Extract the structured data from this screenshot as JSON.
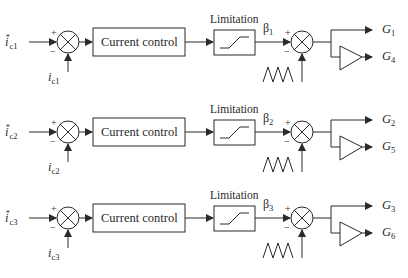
{
  "rows": [
    {
      "reference": {
        "symbol": "i",
        "super": "*",
        "sub": "c1"
      },
      "feedback": {
        "symbol": "i",
        "sub": "c1"
      },
      "controller_label": "Current control",
      "limiter_label": "Limitation",
      "beta": {
        "symbol": "β",
        "sub": "1"
      },
      "output_direct": {
        "symbol": "G",
        "sub": "1"
      },
      "output_inverted": {
        "symbol": "G",
        "sub": "4"
      }
    },
    {
      "reference": {
        "symbol": "i",
        "super": "*",
        "sub": "c2"
      },
      "feedback": {
        "symbol": "i",
        "sub": "c2"
      },
      "controller_label": "Current control",
      "limiter_label": "Limitation",
      "beta": {
        "symbol": "β",
        "sub": "2"
      },
      "output_direct": {
        "symbol": "G",
        "sub": "2"
      },
      "output_inverted": {
        "symbol": "G",
        "sub": "5"
      }
    },
    {
      "reference": {
        "symbol": "i",
        "super": "*",
        "sub": "c3"
      },
      "feedback": {
        "symbol": "i",
        "sub": "c3"
      },
      "controller_label": "Current control",
      "limiter_label": "Limitation",
      "beta": {
        "symbol": "β",
        "sub": "3"
      },
      "output_direct": {
        "symbol": "G",
        "sub": "3"
      },
      "output_inverted": {
        "symbol": "G",
        "sub": "6"
      }
    }
  ],
  "signs": {
    "plus": "+",
    "minus": "−"
  },
  "colors": {
    "stroke": "#2a2a2a",
    "background": "#ffffff"
  }
}
